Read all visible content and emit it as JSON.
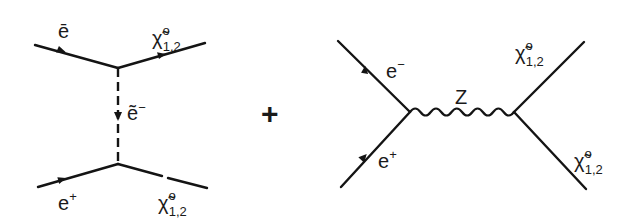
{
  "figure": {
    "operator": "+",
    "diagrams": [
      {
        "name": "t-channel selectron exchange",
        "particles": {
          "incoming_top": {
            "symbol": "ē",
            "sup": "",
            "sub": ""
          },
          "outgoing_top": {
            "symbol": "χ̃",
            "sup": "o",
            "sub": "1,2"
          },
          "propagator": {
            "symbol": "ẽ",
            "sup": "−",
            "sub": ""
          },
          "incoming_bottom": {
            "symbol": "e",
            "sup": "+",
            "sub": ""
          },
          "outgoing_bottom": {
            "symbol": "χ̃",
            "sup": "o",
            "sub": "1,2"
          }
        }
      },
      {
        "name": "s-channel Z exchange",
        "particles": {
          "incoming_top": {
            "symbol": "e",
            "sup": "−",
            "sub": ""
          },
          "incoming_bottom": {
            "symbol": "e",
            "sup": "+",
            "sub": ""
          },
          "propagator": {
            "symbol": "Z",
            "sup": "",
            "sub": ""
          },
          "outgoing_top": {
            "symbol": "χ̃",
            "sup": "o",
            "sub": "1,2"
          },
          "outgoing_bottom": {
            "symbol": "χ̃",
            "sup": "o",
            "sub": "1,2"
          }
        }
      }
    ],
    "colors": {
      "ink": "#141414",
      "background": "#ffffff"
    }
  }
}
